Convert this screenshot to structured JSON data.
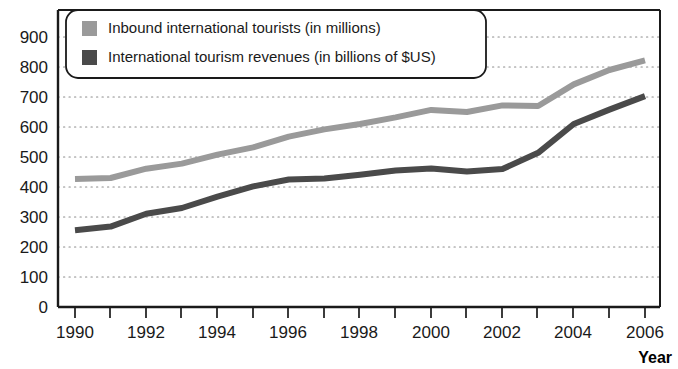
{
  "chart_data": {
    "type": "line",
    "title": "",
    "xlabel": "Year",
    "ylabel": "",
    "x": [
      1990,
      1991,
      1992,
      1993,
      1994,
      1995,
      1996,
      1997,
      1998,
      1999,
      2000,
      2001,
      2002,
      2003,
      2004,
      2005,
      2006
    ],
    "categories": [
      "1990",
      "1991",
      "1992",
      "1993",
      "1994",
      "1995",
      "1996",
      "1997",
      "1998",
      "1999",
      "2000",
      "2001",
      "2002",
      "2003",
      "2004",
      "2005",
      "2006"
    ],
    "series": [
      {
        "name": "Inbound international tourists (in millions)",
        "color": "#9a9a9a",
        "values": [
          427,
          430,
          461,
          478,
          508,
          532,
          568,
          592,
          610,
          632,
          657,
          650,
          672,
          670,
          742,
          790,
          822
        ]
      },
      {
        "name": "International tourism revenues (in billions of $US)",
        "color": "#4a4a4a",
        "values": [
          256,
          268,
          311,
          330,
          368,
          402,
          425,
          428,
          441,
          455,
          462,
          452,
          460,
          514,
          610,
          658,
          703
        ]
      }
    ],
    "xlim": [
      1990,
      2006
    ],
    "ylim": [
      0,
      900
    ],
    "y_ticks": [
      0,
      100,
      200,
      300,
      400,
      500,
      600,
      700,
      800,
      900
    ],
    "x_ticks_major": [
      "1990",
      "1992",
      "1994",
      "1996",
      "1998",
      "2000",
      "2002",
      "2004",
      "2006"
    ],
    "x_tick_years_minor": [
      1991,
      1993,
      1995,
      1997,
      1999,
      2001,
      2003,
      2005
    ],
    "grid": "horizontal-dotted",
    "legend_position": "top-left-inside"
  },
  "legend": {
    "items": [
      {
        "label": "Inbound international tourists (in millions)",
        "swatch": "#9a9a9a"
      },
      {
        "label": "International tourism revenues (in billions of $US)",
        "swatch": "#4a4a4a"
      }
    ]
  },
  "axes": {
    "y_labels": [
      "900",
      "800",
      "700",
      "600",
      "500",
      "400",
      "300",
      "200",
      "100",
      "0"
    ],
    "x_labels": [
      "1990",
      "1992",
      "1994",
      "1996",
      "1998",
      "2000",
      "2002",
      "2004",
      "2006"
    ],
    "x_title": "Year"
  },
  "colors": {
    "series_light": "#9a9a9a",
    "series_dark": "#4a4a4a",
    "axis": "#1a1a1a",
    "grid": "#8c8c8c",
    "background": "#ffffff"
  }
}
